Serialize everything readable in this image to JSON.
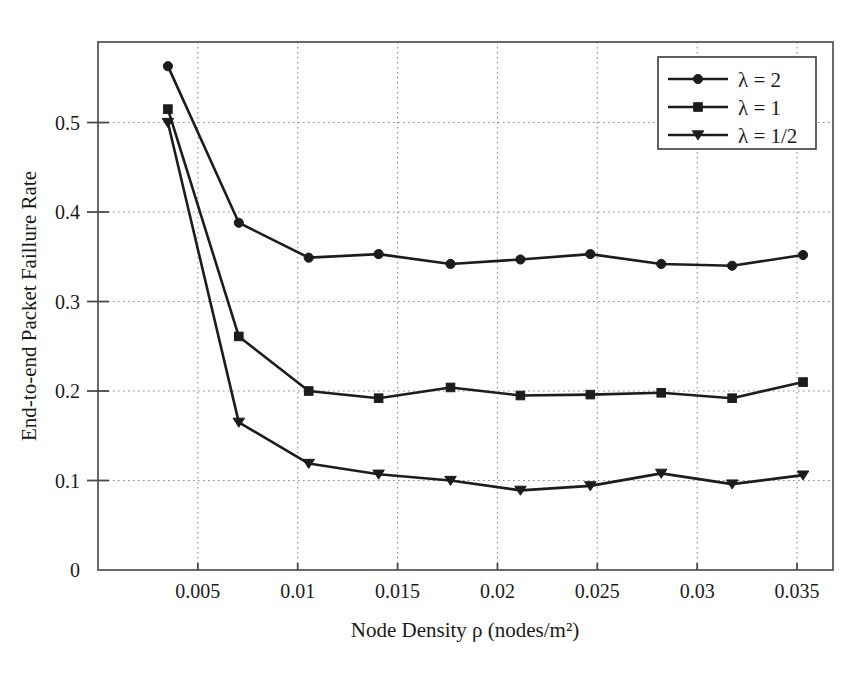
{
  "chart_data": {
    "type": "line",
    "title": "",
    "xlabel": "Node Density ρ (nodes/m²)",
    "ylabel": "End-to-end Packet Faillure Rate",
    "xlim": [
      0.0,
      0.0368
    ],
    "ylim": [
      0.0,
      0.59
    ],
    "grid": true,
    "legend_position": "top-right",
    "xticks": [
      0.005,
      0.01,
      0.015,
      0.02,
      0.025,
      0.03,
      0.035
    ],
    "xtick_labels": [
      "0.005",
      "0.01",
      "0.015",
      "0.02",
      "0.025",
      "0.03",
      "0.035"
    ],
    "yticks": [
      0,
      0.1,
      0.2,
      0.3,
      0.4,
      0.5
    ],
    "ytick_labels": [
      "0",
      "0.1",
      "0.2",
      "0.3",
      "0.4",
      "0.5"
    ],
    "x": [
      0.0035,
      0.00705,
      0.01055,
      0.01405,
      0.01765,
      0.02115,
      0.02465,
      0.0282,
      0.03175,
      0.0353
    ],
    "series": [
      {
        "name": "λ = 2",
        "marker": "circle",
        "color": "#1c1c1c",
        "values": [
          0.563,
          0.388,
          0.349,
          0.353,
          0.342,
          0.347,
          0.353,
          0.342,
          0.34,
          0.352
        ]
      },
      {
        "name": "λ = 1",
        "marker": "square",
        "color": "#1c1c1c",
        "values": [
          0.515,
          0.261,
          0.2,
          0.192,
          0.204,
          0.195,
          0.196,
          0.198,
          0.192,
          0.21
        ]
      },
      {
        "name": "λ = 1/2",
        "marker": "triangle-down",
        "color": "#1c1c1c",
        "values": [
          0.5,
          0.165,
          0.119,
          0.107,
          0.1,
          0.089,
          0.094,
          0.108,
          0.096,
          0.106
        ]
      }
    ]
  },
  "legend": {
    "entries": [
      {
        "label": "λ = 2",
        "marker": "circle-marker"
      },
      {
        "label": "λ = 1",
        "marker": "square-marker"
      },
      {
        "label": "λ = 1/2",
        "marker": "triangle-down-marker"
      }
    ]
  },
  "axes": {
    "x_title": "Node Density ρ (nodes/m²)",
    "y_title": "End-to-end Packet Faillure Rate",
    "x_tick_labels": [
      "0.005",
      "0.01",
      "0.015",
      "0.02",
      "0.025",
      "0.03",
      "0.035"
    ],
    "y_tick_labels": [
      "0.5",
      "0.4",
      "0.3",
      "0.2",
      "0.1",
      "0"
    ]
  }
}
